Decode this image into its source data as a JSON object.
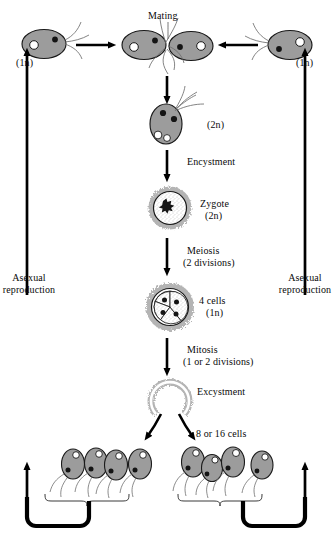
{
  "diagram": {
    "type": "biological-life-cycle-diagram",
    "colors": {
      "cell_fill": "#9c9c9c",
      "cell_stroke": "#1a1a1a",
      "cyst_halo": "#b4b4b4",
      "arrow": "#000000",
      "background": "#ffffff",
      "flagella": "#6b6b6b"
    }
  },
  "labels": {
    "mating": "Mating",
    "ploidy_left": "(1n)",
    "ploidy_right": "(1n)",
    "zygote_cell_ploidy": "(2n)",
    "encystment": "Encystment",
    "zygote_name": "Zygote",
    "zygote_ploidy": "(2n)",
    "meiosis": "Meiosis",
    "meiosis_detail": "(2 divisions)",
    "four_cells": "4 cells",
    "four_cells_ploidy": "(1n)",
    "mitosis": "Mitosis",
    "mitosis_detail": "(1 or 2 divisions)",
    "excystment": "Excystment",
    "offspring_count": "8 or 16 cells",
    "asexual_left_line1": "Asexual",
    "asexual_left_line2": "reproduction",
    "asexual_right_line1": "Asexual",
    "asexual_right_line2": "reproduction"
  },
  "stages": [
    {
      "id": "gamete-left",
      "name": "Haploid gamete (left)",
      "ploidy": "1n",
      "nuclei": 2,
      "flagellated": true
    },
    {
      "id": "mating-pair",
      "name": "Mating pair",
      "ploidy": "1n",
      "nuclei": 4,
      "flagellated": true
    },
    {
      "id": "gamete-right",
      "name": "Haploid gamete (right)",
      "ploidy": "1n",
      "nuclei": 2,
      "flagellated": true
    },
    {
      "id": "zygote-motile",
      "name": "Motile zygote",
      "ploidy": "2n",
      "nuclei": 4,
      "flagellated": true
    },
    {
      "id": "zygote-cyst",
      "name": "Zygote cyst",
      "ploidy": "2n",
      "nuclei": 1,
      "flagellated": false
    },
    {
      "id": "four-cell-cyst",
      "name": "Four-cell cyst",
      "ploidy": "1n",
      "nuclei": 4,
      "flagellated": false
    },
    {
      "id": "ruptured-cyst",
      "name": "Ruptured cyst",
      "ploidy": "1n",
      "nuclei": 0,
      "flagellated": false
    },
    {
      "id": "offspring-left",
      "name": "Offspring group left",
      "ploidy": "1n",
      "nuclei": 8,
      "flagellated": true
    },
    {
      "id": "offspring-right",
      "name": "Offspring group right",
      "ploidy": "1n",
      "nuclei": 8,
      "flagellated": true
    }
  ],
  "transitions": [
    {
      "from": "gamete-left",
      "to": "mating-pair",
      "label": "Mating",
      "direction": "right"
    },
    {
      "from": "gamete-right",
      "to": "mating-pair",
      "label": "Mating",
      "direction": "left"
    },
    {
      "from": "mating-pair",
      "to": "zygote-motile",
      "label": "",
      "direction": "down"
    },
    {
      "from": "zygote-motile",
      "to": "zygote-cyst",
      "label": "Encystment",
      "direction": "down"
    },
    {
      "from": "zygote-cyst",
      "to": "four-cell-cyst",
      "label": "Meiosis (2 divisions)",
      "direction": "down"
    },
    {
      "from": "four-cell-cyst",
      "to": "ruptured-cyst",
      "label": "Mitosis (1 or 2 divisions)",
      "direction": "down"
    },
    {
      "from": "ruptured-cyst",
      "to": "offspring-left",
      "label": "Excystment",
      "direction": "down-left"
    },
    {
      "from": "ruptured-cyst",
      "to": "offspring-right",
      "label": "Excystment",
      "direction": "down-right"
    },
    {
      "from": "offspring-left",
      "to": "gamete-left",
      "label": "Asexual reproduction",
      "direction": "up"
    },
    {
      "from": "offspring-right",
      "to": "gamete-right",
      "label": "Asexual reproduction",
      "direction": "up"
    }
  ]
}
